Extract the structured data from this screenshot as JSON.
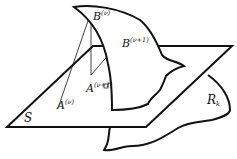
{
  "diagram": {
    "type": "geometric-surface-projection",
    "labels": {
      "plane": "S",
      "region": "R",
      "region_sub": "k",
      "point_A_v": "A",
      "point_A_v_sup": "(ν)",
      "point_A_v1": "A",
      "point_A_v1_sup": "(ν+1)",
      "point_B_v": "B",
      "point_B_v_sup": "(ν)",
      "point_B_v1": "B",
      "point_B_v1_sup": "(ν+1)"
    },
    "colors": {
      "stroke": "#111111",
      "background": "#ffffff"
    }
  }
}
